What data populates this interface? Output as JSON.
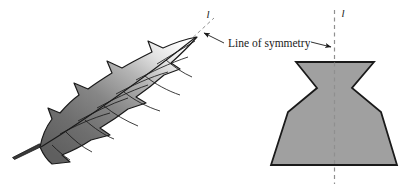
{
  "figure": {
    "callout_label": "Line of symmetry",
    "left_axis_letter": "l",
    "right_axis_letter": "l",
    "colors": {
      "outline": "#1a1a1a",
      "dashed_line": "#8c8c8c",
      "shape_fill": "#9e9e9e",
      "leaf_dark": "#6e6e6e",
      "leaf_light": "#fbfbfb",
      "background": "#ffffff",
      "text": "#1a1a1a"
    },
    "left_figure": {
      "name": "leaf",
      "description": "serrated leaf with central vein and side veins, shaded light to dark",
      "symmetry_line": "diagonal dashed line through leaf tip"
    },
    "right_figure": {
      "name": "vase-polygon",
      "description": "symmetric vase/bell shaped polygon with flared top, pinched neck and wide flat base",
      "symmetry_line": "vertical dashed line through centre"
    }
  }
}
